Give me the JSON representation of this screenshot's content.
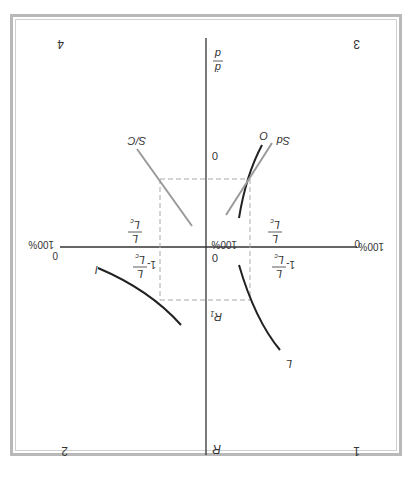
{
  "figure": {
    "orientation": "rotated-180",
    "quadrants": [
      {
        "id": "1",
        "label": "1"
      },
      {
        "id": "2",
        "label": "2"
      },
      {
        "id": "3",
        "label": "3"
      },
      {
        "id": "4",
        "label": "4"
      }
    ],
    "axes": {
      "vertical_top_label": "R",
      "vertical_bottom_label": "ḋ/d",
      "vertical_mid_lower_label": "R₁",
      "origin_label": "0",
      "upper_zero_label": "0",
      "center_percent_label": "100%",
      "left_end": {
        "zero": "0",
        "percent": "100%"
      },
      "right_end": {
        "zero": "0",
        "percent": "100%"
      }
    },
    "fractions": {
      "left_upper": {
        "num": "L",
        "den": "L_c",
        "prefix": "1-"
      },
      "right_upper": {
        "num": "L",
        "den": "L_c",
        "prefix": "1-"
      },
      "left_lower": {
        "num": "L",
        "den": "L_c",
        "prefix": ""
      },
      "right_lower": {
        "num": "L",
        "den": "L_c",
        "prefix": ""
      }
    },
    "curves": [
      {
        "name": "I",
        "label": "I",
        "color": "#222222"
      },
      {
        "name": "L",
        "label": "L",
        "color": "#222222"
      },
      {
        "name": "O",
        "label": "O",
        "color": "#222222"
      },
      {
        "name": "Sd",
        "label": "Sd",
        "color": "#9a9a9a"
      },
      {
        "name": "S/C",
        "label": "S/C",
        "color": "#9a9a9a"
      }
    ],
    "colors": {
      "axis": "#333333",
      "dashed_guide": "#aaaaaa",
      "frame": "#b9b9b9"
    }
  }
}
